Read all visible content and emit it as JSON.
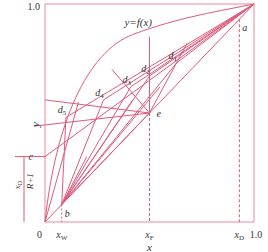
{
  "diagram": {
    "type": "xy-equilibrium-diagram",
    "colors": {
      "line": "#e05a7a",
      "frame": "#e88aa0",
      "dash": "#e05a7a",
      "text": "#333333"
    },
    "axis": {
      "y_top_label": "1.0",
      "y_label": "y",
      "x_label": "x",
      "origin_label": "0",
      "x_ticks": [
        {
          "id": "xW",
          "main": "x",
          "sub": "W",
          "value": 0.08
        },
        {
          "id": "xF",
          "main": "x",
          "sub": "F",
          "value": 0.5
        },
        {
          "id": "xD",
          "main": "x",
          "sub": "D",
          "value": 0.93
        }
      ],
      "x_end_label": "1.0"
    },
    "curve_label": "y=f(x)",
    "intercept": {
      "label": "c",
      "fraction_num_main": "x",
      "fraction_num_sub": "D",
      "fraction_den": "R+1"
    },
    "points": {
      "a": {
        "label": "a",
        "x": 0.93,
        "y": 0.93
      },
      "b": {
        "label": "b",
        "x": 0.08,
        "y": 0.08
      },
      "e": {
        "label": "e",
        "x": 0.5,
        "y": 0.5
      },
      "c": {
        "label": "c",
        "x": 0,
        "y": 0.3
      },
      "d1": {
        "label": "d",
        "sub": "1",
        "x": 0.63,
        "y": 0.73
      },
      "d2": {
        "label": "d",
        "sub": "2",
        "x": 0.5,
        "y": 0.67
      },
      "d3": {
        "label": "d",
        "sub": "3",
        "x": 0.41,
        "y": 0.62
      },
      "d4": {
        "label": "d",
        "sub": "4",
        "x": 0.28,
        "y": 0.56
      },
      "d5": {
        "label": "d",
        "sub": "5",
        "x": 0.1,
        "y": 0.48
      }
    }
  }
}
